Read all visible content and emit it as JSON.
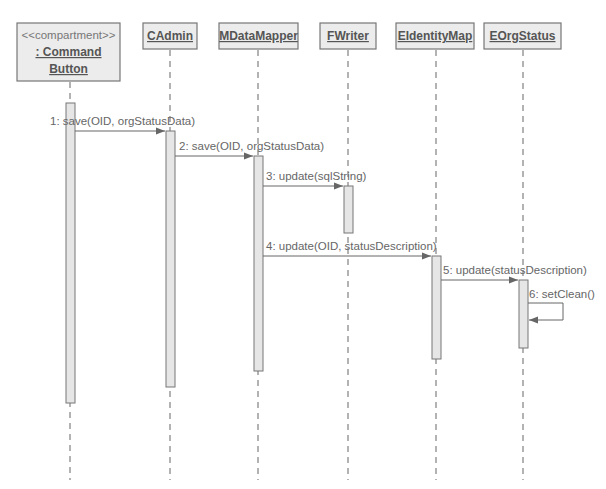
{
  "diagram": {
    "type": "UML sequence diagram",
    "colors": {
      "box_fill": "#ececec",
      "box_stroke": "#777777",
      "text": "#555555",
      "line": "#666666",
      "activation_fill": "#e6e6e6"
    },
    "participants": [
      {
        "id": "p0",
        "stereotype": "<<compartment>>",
        "name_line1": ": Command",
        "name_line2": "Button",
        "name": ": Command Button"
      },
      {
        "id": "p1",
        "name": "CAdmin"
      },
      {
        "id": "p2",
        "name": "MDataMapper"
      },
      {
        "id": "p3",
        "name": "FWriter"
      },
      {
        "id": "p4",
        "name": "EIdentityMap"
      },
      {
        "id": "p5",
        "name": "EOrgStatus"
      }
    ],
    "messages": [
      {
        "seq": 1,
        "from": ": Command Button",
        "to": "CAdmin",
        "label": "1: save(OID, orgStatusData)"
      },
      {
        "seq": 2,
        "from": "CAdmin",
        "to": "MDataMapper",
        "label": "2: save(OID, orgStatusData)"
      },
      {
        "seq": 3,
        "from": "MDataMapper",
        "to": "FWriter",
        "label": "3: update(sqlString)"
      },
      {
        "seq": 4,
        "from": "MDataMapper",
        "to": "EIdentityMap",
        "label": "4: update(OID, statusDescription)"
      },
      {
        "seq": 5,
        "from": "EIdentityMap",
        "to": "EOrgStatus",
        "label": "5: update(statusDescription)"
      },
      {
        "seq": 6,
        "from": "EOrgStatus",
        "to": "EOrgStatus",
        "label": "6: setClean()",
        "self_call": true
      }
    ]
  }
}
